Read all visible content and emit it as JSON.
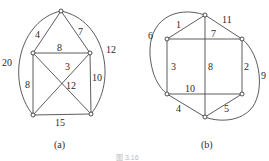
{
  "figure": {
    "caption_fragment": "图 3.16",
    "graphs": [
      {
        "id": "a",
        "caption": "(a)",
        "nodes": [
          {
            "id": "top",
            "x": 61,
            "y": 11
          },
          {
            "id": "ml",
            "x": 33,
            "y": 53
          },
          {
            "id": "mr",
            "x": 90,
            "y": 53
          },
          {
            "id": "bl",
            "x": 33,
            "y": 115
          },
          {
            "id": "br",
            "x": 91,
            "y": 114
          }
        ],
        "edges": [
          {
            "from": "top",
            "to": "ml",
            "weight": "4"
          },
          {
            "from": "top",
            "to": "mr",
            "weight": "7"
          },
          {
            "from": "ml",
            "to": "mr",
            "weight": "8"
          },
          {
            "from": "ml",
            "to": "bl",
            "weight": "8"
          },
          {
            "from": "mr",
            "to": "br",
            "weight": "10"
          },
          {
            "from": "bl",
            "to": "br",
            "weight": "15"
          },
          {
            "from": "mr",
            "to": "bl",
            "weight": "3"
          },
          {
            "from": "ml",
            "to": "br",
            "weight": "12"
          },
          {
            "from": "top",
            "to": "bl",
            "weight": "20",
            "curved": true
          },
          {
            "from": "top",
            "to": "br",
            "weight": "12",
            "curved": true
          }
        ]
      },
      {
        "id": "b",
        "caption": "(b)",
        "nodes": [
          {
            "id": "top",
            "x": 205,
            "y": 15
          },
          {
            "id": "ul",
            "x": 167,
            "y": 39
          },
          {
            "id": "ur",
            "x": 242,
            "y": 39
          },
          {
            "id": "ll",
            "x": 167,
            "y": 94
          },
          {
            "id": "lr",
            "x": 242,
            "y": 94
          },
          {
            "id": "bot",
            "x": 205,
            "y": 117
          }
        ],
        "edges": [
          {
            "from": "top",
            "to": "ul",
            "weight": "1"
          },
          {
            "from": "top",
            "to": "ur",
            "weight": "11"
          },
          {
            "from": "ul",
            "to": "ur",
            "weight": "7"
          },
          {
            "from": "ul",
            "to": "ll",
            "weight": "3"
          },
          {
            "from": "top",
            "to": "bot",
            "weight": "8"
          },
          {
            "from": "ur",
            "to": "lr",
            "weight": "2"
          },
          {
            "from": "ll",
            "to": "lr",
            "weight": "10"
          },
          {
            "from": "ll",
            "to": "bot",
            "weight": "4"
          },
          {
            "from": "lr",
            "to": "bot",
            "weight": "5"
          },
          {
            "from": "top",
            "to": "ll",
            "weight": "6",
            "curved": true
          },
          {
            "from": "ur",
            "to": "bot",
            "weight": "9",
            "curved": true
          }
        ]
      }
    ]
  },
  "labels": {
    "a": {
      "w4": "4",
      "w7": "7",
      "w8top": "8",
      "w8left": "8",
      "w3": "3",
      "w12diag": "12",
      "w10": "10",
      "w15": "15",
      "w20": "20",
      "w12arc": "12",
      "caption": "(a)"
    },
    "b": {
      "w1": "1",
      "w11": "11",
      "w7": "7",
      "w6": "6",
      "w3": "3",
      "w8": "8",
      "w2": "2",
      "w9": "9",
      "w10": "10",
      "w4": "4",
      "w5": "5",
      "caption": "(b)"
    }
  }
}
